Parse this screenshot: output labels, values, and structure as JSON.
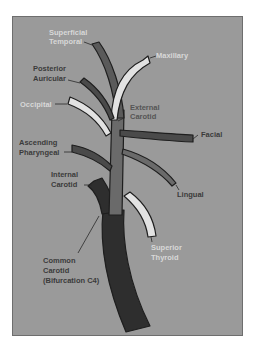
{
  "diagram": {
    "colors": {
      "background": "#9a9a9a",
      "common_carotid": "#2e2e2e",
      "external_carotid": "#6a6a6a",
      "dark_branch": "#4a4a4a",
      "light_branch": "#e2e2e2",
      "outline": "#1e1e1e"
    },
    "labels": {
      "superficial_temporal_1": "Superficial",
      "superficial_temporal_2": "Temporal",
      "maxillary": "Maxillary",
      "posterior_auricular_1": "Posterior",
      "posterior_auricular_2": "Auricular",
      "occipital": "Occipital",
      "external_carotid_1": "External",
      "external_carotid_2": "Carotid",
      "facial": "Facial",
      "ascending_pharyngeal_1": "Ascending",
      "ascending_pharyngeal_2": "Pharyngeal",
      "lingual": "Lingual",
      "internal_carotid_1": "Internal",
      "internal_carotid_2": "Carotid",
      "superior_thyroid_1": "Superior",
      "superior_thyroid_2": "Thyroid",
      "common_carotid_1": "Common",
      "common_carotid_2": "Carotid",
      "common_carotid_3": "(Bifurcation C4)"
    }
  }
}
